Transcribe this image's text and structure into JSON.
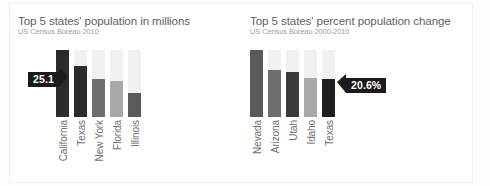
{
  "chart_data": [
    {
      "type": "bar",
      "id": "population",
      "title": "Top 5 states' population in millions",
      "subtitle": "US Census Bureau 2010",
      "xlabel": "",
      "ylabel": "Population (millions)",
      "ylim": [
        0,
        40
      ],
      "grid": false,
      "legend": "none",
      "categories": [
        "California",
        "Texas",
        "New York",
        "Florida",
        "Illinois"
      ],
      "values": [
        37.3,
        25.1,
        19.4,
        18.8,
        12.8
      ],
      "bar_colors": [
        "#2b2b2b",
        "#2b2b2b",
        "#6e6e6e",
        "#a8a8a8",
        "#5a5a5a"
      ],
      "track_color": "#f0f0f0",
      "annotation": {
        "label": "25.1",
        "target_category": "California",
        "pointer": "right"
      }
    },
    {
      "type": "bar",
      "id": "percent-change",
      "title": "Top 5 states' percent population change",
      "subtitle": "US Census Bureau 2000-2010",
      "xlabel": "",
      "ylabel": "Percent change",
      "ylim": [
        0,
        40
      ],
      "grid": false,
      "legend": "none",
      "categories": [
        "Nevada",
        "Arizona",
        "Utah",
        "Idaho",
        "Texas"
      ],
      "values": [
        35.1,
        24.6,
        23.8,
        21.1,
        20.6
      ],
      "bar_colors": [
        "#5a5a5a",
        "#6e6e6e",
        "#3a3a3a",
        "#a8a8a8",
        "#1f1f1f"
      ],
      "track_color": "#f0f0f0",
      "annotation": {
        "label": "20.6%",
        "target_category": "Texas",
        "pointer": "left"
      }
    }
  ],
  "left": {
    "title": "Top 5 states' population in millions",
    "subtitle": "US Census Bureau 2010",
    "callout": "25.1",
    "bars": [
      {
        "label": "California",
        "fill_pct": 100,
        "color": "#2b2b2b"
      },
      {
        "label": "Texas",
        "fill_pct": 76,
        "color": "#2b2b2b"
      },
      {
        "label": "New York",
        "fill_pct": 56,
        "color": "#6e6e6e"
      },
      {
        "label": "Florida",
        "fill_pct": 54,
        "color": "#a8a8a8"
      },
      {
        "label": "Illinois",
        "fill_pct": 36,
        "color": "#5a5a5a"
      }
    ]
  },
  "right": {
    "title": "Top 5 states' percent population change",
    "subtitle": "US Census Bureau 2000-2010",
    "callout": "20.6%",
    "bars": [
      {
        "label": "Nevada",
        "fill_pct": 100,
        "color": "#5a5a5a"
      },
      {
        "label": "Arizona",
        "fill_pct": 70,
        "color": "#6e6e6e"
      },
      {
        "label": "Utah",
        "fill_pct": 67,
        "color": "#3a3a3a"
      },
      {
        "label": "Idaho",
        "fill_pct": 58,
        "color": "#a8a8a8"
      },
      {
        "label": "Texas",
        "fill_pct": 56,
        "color": "#1f1f1f"
      }
    ]
  }
}
